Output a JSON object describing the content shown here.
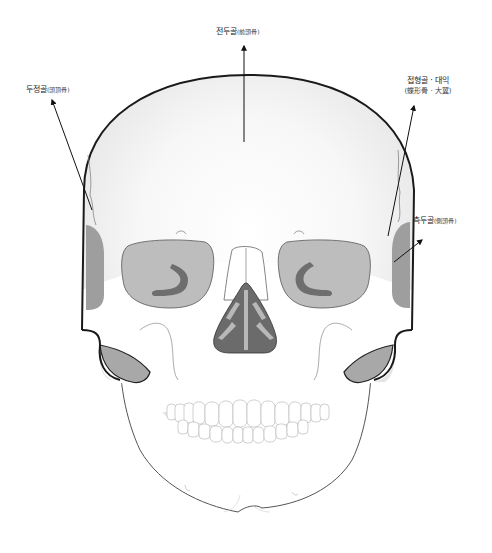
{
  "diagram": {
    "labels": {
      "frontal": {
        "korean": "전두골",
        "hanja": "(前頭骨)"
      },
      "parietal": {
        "korean": "두정골",
        "hanja": "(頭頂骨)"
      },
      "sphenoid": {
        "korean": "접형골 · 대익",
        "hanja": "(蝶形骨 · 大翼)"
      },
      "temporal": {
        "korean": "측두골",
        "hanja": "(側頭骨)"
      }
    },
    "colors": {
      "outline": "#1a1a1a",
      "bone_light": "#f2f2f2",
      "bone_white": "#ffffff",
      "orbit_fill": "#bdbdbd",
      "orbit_dark": "#6e6e6e",
      "nasal_dark": "#6b6b6b",
      "nasal_light": "#b8b8b8",
      "temporal_fill": "#9e9e9e",
      "jaw_shade": "#a8a8a8",
      "tooth_line": "#bbbbbb"
    }
  }
}
